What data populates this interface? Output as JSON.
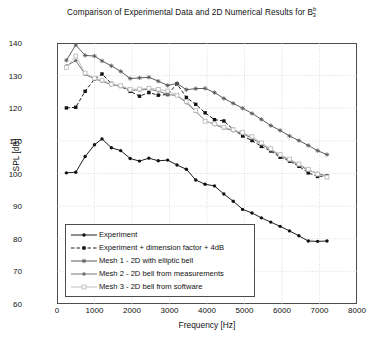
{
  "chart_data": {
    "type": "line",
    "title": "Comparison of Experimental Data and 2D Numerical Results for B",
    "title_sub": "3",
    "title_sup": "b",
    "xlabel": "Frequency [Hz]",
    "ylabel": "SPL [dB]",
    "xlim": [
      0,
      8000
    ],
    "ylim": [
      60,
      140
    ],
    "xticks": [
      0,
      1000,
      2000,
      3000,
      4000,
      5000,
      6000,
      7000,
      8000
    ],
    "yticks": [
      60,
      70,
      80,
      90,
      100,
      110,
      120,
      130,
      140
    ],
    "grid": true,
    "legend_position": "lower-left",
    "series": [
      {
        "name": "Experiment",
        "color": "#111111",
        "style": "solid",
        "marker": "filled-dot",
        "x": [
          250,
          500,
          750,
          1000,
          1200,
          1450,
          1700,
          1950,
          2200,
          2450,
          2700,
          2950,
          3200,
          3450,
          3700,
          3950,
          4200,
          4450,
          4700,
          4950,
          5200,
          5450,
          5700,
          5950,
          6200,
          6450,
          6700,
          6950,
          7200
        ],
        "y": [
          100.2,
          100.4,
          105.2,
          108.8,
          110.6,
          107.9,
          107.0,
          104.6,
          103.8,
          104.7,
          103.9,
          104.1,
          102.6,
          101.3,
          98.0,
          96.7,
          96.2,
          93.7,
          91.5,
          89.0,
          87.9,
          86.4,
          85.1,
          83.8,
          82.4,
          80.9,
          79.3,
          79.2,
          79.3
        ]
      },
      {
        "name": "Experiment + dimension factor + 4dB",
        "color": "#111111",
        "style": "dashed",
        "marker": "filled-square",
        "x": [
          250,
          500,
          750,
          1000,
          1200,
          1450,
          1700,
          1950,
          2200,
          2450,
          2700,
          2950,
          3200,
          3450,
          3700,
          3950,
          4200,
          4450,
          4700,
          4950,
          5200,
          5450,
          5700,
          5950,
          6200,
          6450,
          6700,
          6950,
          7200
        ],
        "y": [
          120.1,
          120.3,
          125.2,
          128.9,
          130.5,
          127.6,
          126.7,
          125.2,
          123.7,
          124.8,
          124.0,
          124.2,
          127.5,
          123.3,
          121.2,
          118.6,
          116.5,
          116.1,
          113.5,
          111.5,
          110.1,
          108.3,
          106.9,
          105.0,
          103.8,
          102.2,
          100.2,
          99.1,
          99.3
        ]
      },
      {
        "name": "Mesh 1 - 2D with elliptic bell",
        "color": "#555555",
        "style": "solid",
        "marker": "star",
        "x": [
          250,
          500,
          750,
          1000,
          1200,
          1450,
          1700,
          1950,
          2200,
          2450,
          2700,
          2950,
          3200,
          3450,
          3700,
          3950,
          4200,
          4450,
          4700,
          4950,
          5200,
          5450,
          5700,
          5950,
          6200,
          6450,
          6700,
          6950,
          7200
        ],
        "y": [
          134.7,
          139.4,
          136.2,
          136.0,
          134.5,
          133.0,
          131.3,
          129.1,
          129.3,
          129.5,
          128.3,
          127.0,
          127.6,
          125.7,
          126.0,
          126.1,
          124.8,
          123.0,
          121.5,
          120.0,
          118.4,
          116.6,
          114.7,
          113.2,
          111.5,
          110.1,
          108.6,
          107.0,
          105.8
        ]
      },
      {
        "name": "Mesh 2 - 2D bell from measurements",
        "color": "#707070",
        "style": "solid",
        "marker": "filled-dot",
        "x": [
          250,
          500,
          750,
          1000,
          1200,
          1450,
          1700,
          1950,
          2200,
          2450,
          2700,
          2950,
          3200,
          3450,
          3700,
          3950,
          4200,
          4450,
          4700,
          4950,
          5200,
          5450,
          5700,
          5950,
          6200,
          6450,
          6700,
          6950,
          7200
        ],
        "y": [
          133.0,
          134.6,
          130.4,
          129.0,
          128.3,
          127.2,
          126.7,
          125.5,
          125.6,
          125.8,
          125.3,
          124.2,
          123.9,
          121.7,
          119.0,
          116.2,
          115.0,
          113.9,
          113.1,
          112.2,
          110.8,
          109.0,
          107.2,
          105.5,
          104.1,
          102.6,
          101.0,
          100.1,
          99.2
        ]
      },
      {
        "name": "Mesh 3 - 2D bell from software",
        "color": "#bdbdbd",
        "style": "solid",
        "marker": "open-square",
        "x": [
          250,
          500,
          750,
          1000,
          1200,
          1450,
          1700,
          1950,
          2200,
          2450,
          2700,
          2950,
          3200,
          3450,
          3700,
          3950,
          4200,
          4450,
          4700,
          4950,
          5200,
          5450,
          5700,
          5950,
          6200,
          6450,
          6700,
          6950,
          7200
        ],
        "y": [
          132.5,
          136.0,
          130.8,
          129.2,
          128.6,
          127.4,
          126.9,
          125.8,
          125.9,
          126.1,
          125.8,
          125.3,
          124.0,
          122.1,
          119.3,
          116.0,
          115.2,
          114.2,
          113.4,
          112.6,
          111.3,
          109.4,
          107.6,
          105.8,
          104.4,
          102.9,
          101.3,
          99.8,
          98.9
        ]
      }
    ]
  }
}
